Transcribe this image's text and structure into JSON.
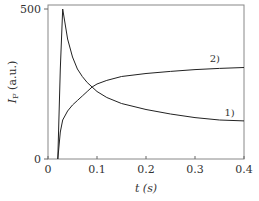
{
  "chart_data": {
    "type": "line",
    "title": "",
    "xlabel": "t (s)",
    "ylabel": "I_F (a.u.)",
    "xlim": [
      0,
      0.4
    ],
    "ylim": [
      0,
      500
    ],
    "xticks": [
      "0",
      "0.1",
      "0.2",
      "0.3",
      "0.4"
    ],
    "yticks": [
      "0",
      "500"
    ],
    "grid": false,
    "series": [
      {
        "name": "1)",
        "x": [
          0.02,
          0.025,
          0.03,
          0.04,
          0.05,
          0.06,
          0.07,
          0.08,
          0.09,
          0.1,
          0.12,
          0.15,
          0.2,
          0.25,
          0.3,
          0.35,
          0.4
        ],
        "values": [
          0,
          300,
          500,
          400,
          340,
          300,
          275,
          255,
          240,
          225,
          205,
          185,
          165,
          150,
          138,
          130,
          127
        ]
      },
      {
        "name": "2)",
        "x": [
          0.02,
          0.025,
          0.03,
          0.04,
          0.05,
          0.06,
          0.07,
          0.08,
          0.09,
          0.1,
          0.12,
          0.15,
          0.2,
          0.25,
          0.3,
          0.35,
          0.4
        ],
        "values": [
          0,
          90,
          130,
          160,
          180,
          195,
          210,
          225,
          240,
          250,
          262,
          275,
          285,
          292,
          298,
          302,
          305
        ]
      }
    ],
    "annotations": [
      {
        "text": "1)",
        "x": 0.36,
        "y": 145
      },
      {
        "text": "2)",
        "x": 0.33,
        "y": 325
      }
    ]
  }
}
